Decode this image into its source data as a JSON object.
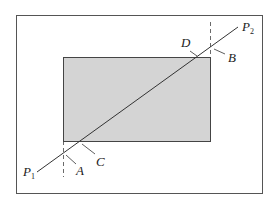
{
  "diagram": {
    "type": "line-clipping",
    "colors": {
      "window_fill": "#d4d4d4",
      "stroke": "#444444",
      "background": "#ffffff"
    },
    "labels": {
      "p1": "P",
      "p1_sub": "1",
      "p2": "P",
      "p2_sub": "2",
      "a": "A",
      "b": "B",
      "c": "C",
      "d": "D"
    }
  }
}
